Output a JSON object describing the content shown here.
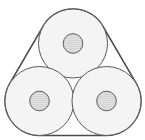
{
  "diagram": {
    "colors": {
      "background": "#ffffff",
      "band_stroke": "#4a4a4a",
      "roll_fill": "#f4f4f4",
      "roll_stroke": "#5a5a5a",
      "core_fill": "#d9d9d9",
      "core_stroke": "#5a5a5a"
    },
    "rolls": [
      {
        "name": "top"
      },
      {
        "name": "bottom-left"
      },
      {
        "name": "bottom-right"
      }
    ]
  }
}
